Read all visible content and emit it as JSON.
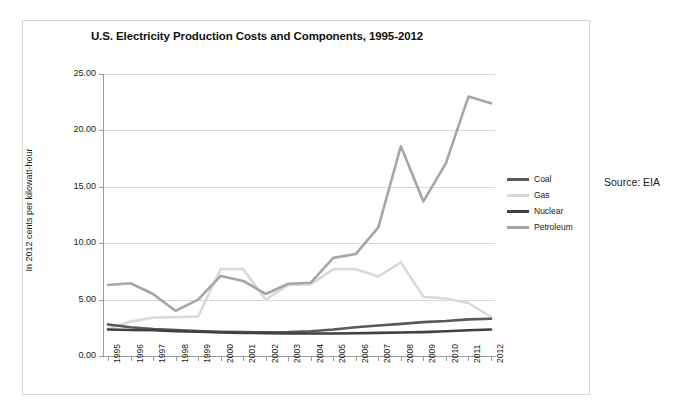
{
  "figure": {
    "source_note": "Source: EIA",
    "background": "#ffffff",
    "frame_color": "#d4d4d4"
  },
  "chart_data": {
    "type": "line",
    "title": "U.S. Electricity Production Costs and Components, 1995-2012",
    "xlabel": "",
    "ylabel": "In 2012 cents per kilowatt-hour",
    "ylim": [
      0,
      25
    ],
    "yticks": [
      0,
      5,
      10,
      15,
      20,
      25
    ],
    "ytick_labels": [
      "0.00",
      "5.00",
      "10.00",
      "15.00",
      "20.00",
      "25.00"
    ],
    "grid": true,
    "legend_position": "right",
    "categories": [
      "1995",
      "1996",
      "1997",
      "1998",
      "1999",
      "2000",
      "2001",
      "2002",
      "2003",
      "2004",
      "2005",
      "2006",
      "2007",
      "2008",
      "2009",
      "2010",
      "2011",
      "2012"
    ],
    "series": [
      {
        "name": "Coal",
        "color": "#595959",
        "values": [
          2.8,
          2.55,
          2.4,
          2.3,
          2.22,
          2.15,
          2.12,
          2.1,
          2.12,
          2.2,
          2.35,
          2.55,
          2.7,
          2.85,
          3.0,
          3.1,
          3.25,
          3.3
        ]
      },
      {
        "name": "Gas",
        "color": "#d9d9d9",
        "values": [
          2.4,
          3.05,
          3.4,
          3.45,
          3.5,
          7.7,
          7.7,
          5.0,
          6.3,
          6.35,
          7.7,
          7.7,
          7.05,
          8.3,
          5.25,
          5.1,
          4.7,
          3.45
        ]
      },
      {
        "name": "Nuclear",
        "color": "#404040",
        "values": [
          2.35,
          2.3,
          2.28,
          2.2,
          2.15,
          2.08,
          2.05,
          2.02,
          2.0,
          2.0,
          2.0,
          2.02,
          2.05,
          2.08,
          2.12,
          2.2,
          2.28,
          2.35
        ]
      },
      {
        "name": "Petroleum",
        "color": "#a6a6a6",
        "values": [
          6.3,
          6.45,
          5.5,
          4.0,
          5.0,
          7.1,
          6.65,
          5.5,
          6.4,
          6.5,
          8.7,
          9.05,
          11.4,
          18.6,
          13.7,
          17.1,
          23.0,
          22.4
        ]
      }
    ]
  }
}
